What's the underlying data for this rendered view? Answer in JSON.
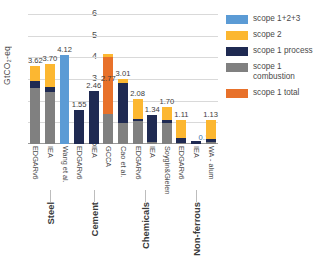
{
  "chart_data": {
    "type": "bar",
    "title": "",
    "xlabel": "",
    "ylabel": "GtCO₂-eq",
    "ylim": [
      0,
      6
    ],
    "yticks": [
      0,
      1,
      2,
      3,
      4,
      5,
      6
    ],
    "grid": true,
    "stacked": true,
    "legend_position": "right",
    "categories": [
      "EDGARv6",
      "IEA",
      "Wang et al.",
      "EDGARv6",
      "IEA",
      "GCCA",
      "Cao et al.",
      "EDGARv6",
      "IEA",
      "Soygin&Gielen",
      "EDGARv6",
      "IEA",
      "WA - alum"
    ],
    "groups": [
      {
        "label": "Steel",
        "start": 0,
        "count": 3
      },
      {
        "label": "Cement",
        "start": 3,
        "count": 3
      },
      {
        "label": "Chemicals",
        "start": 6,
        "count": 4
      },
      {
        "label": "Non-ferrous",
        "start": 10,
        "count": 3
      }
    ],
    "series": [
      {
        "name": "scope 1 combustion",
        "color": "#808080",
        "values": [
          2.6,
          2.42,
          null,
          0.0,
          0.0,
          1.38,
          0.95,
          1.05,
          0.1,
          0.95,
          0.05,
          0.0,
          0.1
        ]
      },
      {
        "name": "scope 1 process",
        "color": "#1f2a52",
        "values": [
          0.3,
          0.22,
          null,
          1.55,
          2.46,
          null,
          1.85,
          0.1,
          1.24,
          0.18,
          0.22,
          0.16,
          0.12
        ]
      },
      {
        "name": "scope 1 total",
        "color": "#e8712a",
        "values": [
          null,
          null,
          null,
          null,
          null,
          2.62,
          null,
          null,
          null,
          null,
          null,
          null,
          null
        ]
      },
      {
        "name": "scope 2",
        "color": "#fcb731",
        "values": [
          0.72,
          1.06,
          null,
          null,
          null,
          0.15,
          0.21,
          0.93,
          0.0,
          0.57,
          0.84,
          null,
          0.91
        ]
      },
      {
        "name": "scope 1+2+3",
        "color": "#5b9bd5",
        "values": [
          null,
          null,
          4.12,
          null,
          null,
          null,
          null,
          null,
          null,
          null,
          null,
          null,
          null
        ]
      }
    ],
    "bar_totals": [
      3.62,
      3.7,
      4.12,
      1.55,
      2.46,
      2.77,
      3.01,
      2.08,
      1.34,
      1.7,
      1.11,
      0.16,
      1.13
    ],
    "value_labels": [
      "3.62",
      "3.70",
      "4.12",
      "1.55",
      "2.46",
      "2.77",
      "3.01",
      "2.08",
      "1.34",
      "1.70",
      "1.11",
      "0.16",
      "1.13"
    ]
  },
  "legend": {
    "items": [
      {
        "label": "scope 1+2+3",
        "color": "#5b9bd5"
      },
      {
        "label": "scope 2",
        "color": "#fcb731"
      },
      {
        "label": "scope 1 process",
        "color": "#1f2a52"
      },
      {
        "label": "scope 1\ncombustion",
        "color": "#808080"
      },
      {
        "label": "scope 1 total",
        "color": "#e8712a"
      }
    ]
  }
}
